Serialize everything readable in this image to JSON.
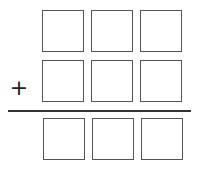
{
  "operator": "+",
  "rows": [
    {
      "name": "addend-1",
      "cells": [
        "",
        "",
        ""
      ]
    },
    {
      "name": "addend-2",
      "cells": [
        "",
        "",
        ""
      ]
    },
    {
      "name": "sum",
      "cells": [
        "",
        "",
        ""
      ]
    }
  ]
}
